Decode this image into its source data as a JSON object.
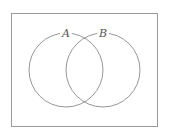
{
  "diagram": {
    "type": "venn",
    "frame": {
      "x": 11,
      "y": 13,
      "width": 146,
      "height": 113,
      "stroke": "#999999"
    },
    "sets": [
      {
        "label": "A",
        "cx": 66,
        "cy": 70,
        "r": 37,
        "label_x": 66,
        "label_y": 37,
        "stroke": "#888888"
      },
      {
        "label": "B",
        "cx": 103,
        "cy": 70,
        "r": 37,
        "label_x": 103,
        "label_y": 37,
        "stroke": "#888888"
      }
    ]
  }
}
